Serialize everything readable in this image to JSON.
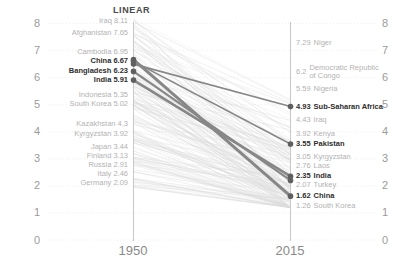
{
  "chart": {
    "mode_label": "LINEAR",
    "x_axis": {
      "left": "1950",
      "right": "2015"
    },
    "y_ticks": [
      8,
      7,
      6,
      5,
      4,
      3,
      2,
      1,
      0
    ],
    "colors": {
      "haze_line": "#dcdcdc",
      "highlight_line": "#878787",
      "dot": "#5f5f5f",
      "muted_label": "#b3b3b3",
      "bold_label": "#2e2e2e",
      "axis_line": "#c8c8c8"
    }
  },
  "chart_data": {
    "type": "line",
    "variant": "slopegraph",
    "x": [
      "1950",
      "2015"
    ],
    "ylim": [
      0,
      8.5
    ],
    "grid": "horizontal-dotted",
    "left_labels": [
      {
        "country": "Iraq",
        "value": 8.11,
        "bold": false
      },
      {
        "country": "Afghanistan",
        "value": 7.65,
        "bold": false
      },
      {
        "country": "Cambodia",
        "value": 6.95,
        "bold": false
      },
      {
        "country": "China",
        "value": 6.67,
        "bold": true
      },
      {
        "country": "Bangladesh",
        "value": 6.23,
        "bold": true
      },
      {
        "country": "India",
        "value": 5.91,
        "bold": true
      },
      {
        "country": "Indonesia",
        "value": 5.35,
        "bold": false
      },
      {
        "country": "South Korea",
        "value": 5.02,
        "bold": false
      },
      {
        "country": "Kazakhstan",
        "value": 4.3,
        "bold": false
      },
      {
        "country": "Kyrgyzstan",
        "value": 3.92,
        "bold": false
      },
      {
        "country": "Japan",
        "value": 3.44,
        "bold": false
      },
      {
        "country": "Finland",
        "value": 3.13,
        "bold": false
      },
      {
        "country": "Russia",
        "value": 2.91,
        "bold": false
      },
      {
        "country": "Italy",
        "value": 2.46,
        "bold": false
      },
      {
        "country": "Germany",
        "value": 2.09,
        "bold": false
      }
    ],
    "right_labels": [
      {
        "country": "Niger",
        "value": 7.29,
        "bold": false
      },
      {
        "country": "Democratic Republic of Congo",
        "value": 6.2,
        "bold": false
      },
      {
        "country": "Nigeria",
        "value": 5.59,
        "bold": false
      },
      {
        "country": "Sub-Saharan Africa",
        "value": 4.93,
        "bold": true
      },
      {
        "country": "Iraq",
        "value": 4.43,
        "bold": false
      },
      {
        "country": "Kenya",
        "value": 3.92,
        "bold": false
      },
      {
        "country": "Pakistan",
        "value": 3.55,
        "bold": true
      },
      {
        "country": "Kyrgyzstan",
        "value": 3.05,
        "bold": false
      },
      {
        "country": "Laos",
        "value": 2.76,
        "bold": false
      },
      {
        "country": "India",
        "value": 2.35,
        "bold": true
      },
      {
        "country": "Turkey",
        "value": 2.07,
        "bold": false
      },
      {
        "country": "China",
        "value": 1.62,
        "bold": true
      },
      {
        "country": "South Korea",
        "value": 1.26,
        "bold": false
      }
    ],
    "highlighted_series": [
      {
        "name": "China",
        "values": [
          6.67,
          1.62
        ]
      },
      {
        "name": "Bangladesh",
        "values": [
          6.23,
          2.2
        ]
      },
      {
        "name": "India",
        "values": [
          5.91,
          2.35
        ]
      },
      {
        "name": "Sub-Saharan Africa",
        "values": [
          6.5,
          4.93
        ]
      },
      {
        "name": "Pakistan",
        "values": [
          6.6,
          3.55
        ]
      }
    ]
  }
}
